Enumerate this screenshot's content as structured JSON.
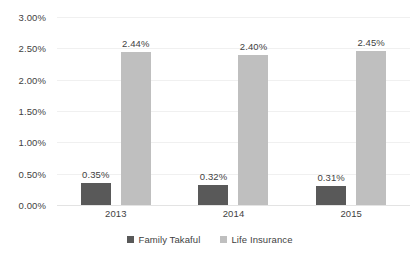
{
  "chart_data": {
    "type": "bar",
    "title": "",
    "subtitle": "",
    "xlabel": "",
    "ylabel": "",
    "categories": [
      "2013",
      "2014",
      "2015"
    ],
    "series": [
      {
        "name": "Family Takaful",
        "color": "#595959",
        "values": [
          0.35,
          0.32,
          0.31
        ],
        "labels": [
          "0.35%",
          "0.32%",
          "0.31%"
        ]
      },
      {
        "name": "Life Insurance",
        "color": "#bfbfbf",
        "values": [
          2.44,
          2.4,
          2.45
        ],
        "labels": [
          "2.44%",
          "2.40%",
          "2.45%"
        ]
      }
    ],
    "ylim": [
      0,
      3.0
    ],
    "ytick_step": 0.5,
    "ytick_labels": [
      "0.00%",
      "0.50%",
      "1.00%",
      "1.50%",
      "2.00%",
      "2.50%",
      "3.00%"
    ],
    "ytick_values": [
      0,
      0.5,
      1.0,
      1.5,
      2.0,
      2.5,
      3.0
    ],
    "grid": true,
    "legend_position": "bottom"
  },
  "legend": {
    "items": [
      {
        "label": "Family Takaful"
      },
      {
        "label": "Life Insurance"
      }
    ]
  }
}
